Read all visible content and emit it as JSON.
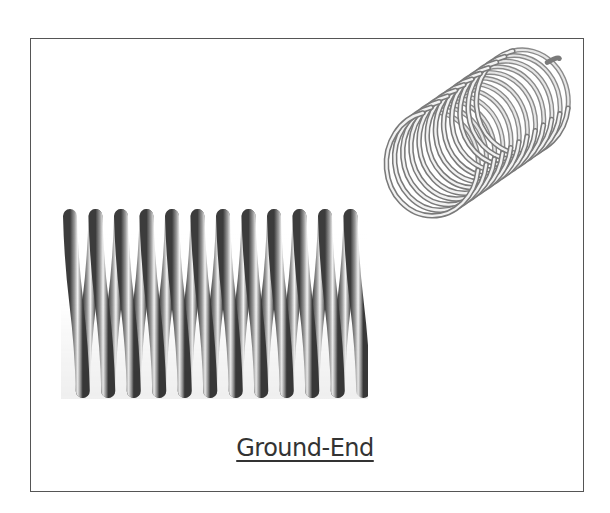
{
  "figure": {
    "caption": "Ground-End",
    "frame_color": "#555555",
    "side_view": {
      "name": "ground-end-spring-side-view",
      "coil_count": 12,
      "x_start": 63,
      "x_end": 368,
      "top_y": 212,
      "bottom_y": 395,
      "pitch": 25.5
    },
    "iso_view": {
      "name": "ground-end-spring-isometric-view",
      "coil_count": 12,
      "front_center": [
        432,
        165
      ],
      "back_center": [
        522,
        103
      ],
      "rx": 46,
      "ry": 52
    }
  }
}
